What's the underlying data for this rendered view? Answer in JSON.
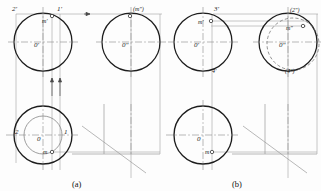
{
  "figure": {
    "captions": [
      {
        "id": "cap-a",
        "text": "(a)",
        "x": 78,
        "y": 186
      },
      {
        "id": "cap-b",
        "text": "(b)",
        "x": 238,
        "y": 186
      }
    ]
  },
  "colors": {
    "outline": "#1d1d1d",
    "thin": "#8a8a8a",
    "center": "#8a8a8a",
    "dashed": "#6f6f6f",
    "text": "#1a1a1a",
    "background": "#fdfdfd"
  },
  "panel_a": {
    "name": "panel-a",
    "front_circle": {
      "cx": 43,
      "cy": 42,
      "r": 29
    },
    "side_circle": {
      "cx": 131,
      "cy": 42,
      "r": 29
    },
    "top_circle": {
      "cx": 43,
      "cy": 135,
      "r": 29
    },
    "top_inner_circle": {
      "cx": 43,
      "cy": 135,
      "r": 19
    },
    "labels": [
      {
        "id": "a-2p",
        "text": "2'",
        "x": 14,
        "y": 11
      },
      {
        "id": "a-1p",
        "text": "1'",
        "x": 58,
        "y": 11
      },
      {
        "id": "a-mp",
        "text": "m'",
        "x": 44,
        "y": 20
      },
      {
        "id": "a-0p",
        "text": "0'",
        "x": 36,
        "y": 46
      },
      {
        "id": "a-m2p",
        "text": "(m\")",
        "x": 134,
        "y": 11
      },
      {
        "id": "a-0pp",
        "text": "0\"",
        "x": 124,
        "y": 46
      },
      {
        "id": "a-2",
        "text": "2",
        "x": 16,
        "y": 133
      },
      {
        "id": "a-1",
        "text": "1",
        "x": 64,
        "y": 133
      },
      {
        "id": "a-0",
        "text": "0",
        "x": 38,
        "y": 140
      },
      {
        "id": "a-m",
        "text": "m",
        "x": 44,
        "y": 152
      }
    ],
    "point_markers": [
      {
        "id": "a-m-front",
        "cx": 52,
        "cy": 16,
        "r": 1.6
      },
      {
        "id": "a-m-side",
        "cx": 130,
        "cy": 16,
        "r": 1.6
      },
      {
        "id": "a-m-top",
        "cx": 52,
        "cy": 152,
        "r": 1.6
      }
    ],
    "projection_origin": {
      "x": 104,
      "y": 154
    }
  },
  "panel_b": {
    "name": "panel-b",
    "front_circle": {
      "cx": 203,
      "cy": 42,
      "r": 29
    },
    "side_circle": {
      "cx": 288,
      "cy": 42,
      "r": 29
    },
    "side_dashed_circle": {
      "cx": 293,
      "cy": 44,
      "r": 26
    },
    "top_circle": {
      "cx": 203,
      "cy": 135,
      "r": 29
    },
    "labels": [
      {
        "id": "b-3p",
        "text": "3'",
        "x": 216,
        "y": 11
      },
      {
        "id": "b-mp",
        "text": "m'",
        "x": 200,
        "y": 24
      },
      {
        "id": "b-0p",
        "text": "0'",
        "x": 196,
        "y": 46
      },
      {
        "id": "b-4p",
        "text": "4'",
        "x": 213,
        "y": 72
      },
      {
        "id": "b-2pp",
        "text": "(2\")",
        "x": 292,
        "y": 12
      },
      {
        "id": "b-mpp",
        "text": "m\"",
        "x": 288,
        "y": 29
      },
      {
        "id": "b-0pp",
        "text": "0\"",
        "x": 281,
        "y": 46
      },
      {
        "id": "b-4pp",
        "text": "(4\")",
        "x": 289,
        "y": 72
      },
      {
        "id": "b-0",
        "text": "0",
        "x": 198,
        "y": 140
      },
      {
        "id": "b-m",
        "text": "m",
        "x": 208,
        "y": 152
      }
    ],
    "point_markers": [
      {
        "id": "b-m-front",
        "cx": 211,
        "cy": 21,
        "r": 1.6
      },
      {
        "id": "b-m-side",
        "cx": 302,
        "cy": 26,
        "r": 1.6
      },
      {
        "id": "b-m-top",
        "cx": 212,
        "cy": 152,
        "r": 1.6
      }
    ],
    "projection_origin": {
      "x": 265,
      "y": 154
    }
  }
}
